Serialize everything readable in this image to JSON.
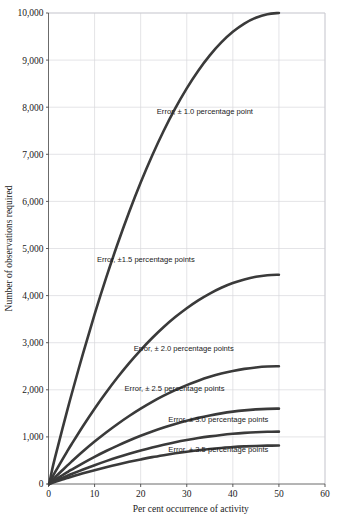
{
  "chart_data": {
    "type": "line",
    "title": "",
    "xlabel": "Per cent occurrence of activity",
    "ylabel": "Number of observations required",
    "xlim": [
      0,
      60
    ],
    "ylim": [
      0,
      10000
    ],
    "xticks": [
      0,
      10,
      20,
      30,
      40,
      50,
      60
    ],
    "xtick_labels": [
      "0",
      "10",
      "20",
      "30",
      "40",
      "50",
      "60"
    ],
    "yticks": [
      0,
      1000,
      2000,
      3000,
      4000,
      5000,
      6000,
      7000,
      8000,
      9000,
      10000
    ],
    "ytick_labels": [
      "0",
      "1,000",
      "2,000",
      "3,000",
      "4,000",
      "5,000",
      "6,000",
      "7,000",
      "8,000",
      "9,000",
      "10,000"
    ],
    "grid": true,
    "legend_position": "inline-annotations",
    "x": [
      1,
      2,
      3,
      4,
      5,
      7.5,
      10,
      12.5,
      15,
      17.5,
      20,
      22.5,
      25,
      27.5,
      30,
      32.5,
      35,
      37.5,
      40,
      42.5,
      45,
      47.5,
      50
    ],
    "series": [
      {
        "name": "Error, ± 1.0 percentage point",
        "error": 1.0,
        "label": "Error,  ± 1.0 percentage point",
        "label_x": 23.5,
        "label_y": 7850,
        "values": [
          396,
          784,
          1164,
          1536,
          1900,
          2775,
          3600,
          4375,
          5100,
          5775,
          6400,
          6975,
          7500,
          7975,
          8400,
          8775,
          9100,
          9375,
          9600,
          9775,
          9900,
          9975,
          10000
        ]
      },
      {
        "name": "Error, ± 1.5 percentage points",
        "error": 1.5,
        "label": "Error,  ±1.5 percentage points",
        "label_x": 10.5,
        "label_y": 4710,
        "values": [
          176,
          348,
          517,
          683,
          844,
          1233,
          1600,
          1944,
          2267,
          2567,
          2844,
          3100,
          3333,
          3544,
          3733,
          3900,
          4044,
          4167,
          4267,
          4344,
          4400,
          4433,
          4444
        ]
      },
      {
        "name": "Error, ± 2.0 percentage points",
        "error": 2.0,
        "label": "Error,  ± 2.0 percentage points",
        "label_x": 18.5,
        "label_y": 2830,
        "values": [
          99,
          196,
          291,
          384,
          475,
          694,
          900,
          1094,
          1275,
          1444,
          1600,
          1744,
          1875,
          1994,
          2100,
          2194,
          2275,
          2344,
          2400,
          2444,
          2475,
          2494,
          2500
        ]
      },
      {
        "name": "Error, ± 2.5 percentage points",
        "error": 2.5,
        "label": "Error,  ± 2.5 percentage points",
        "label_x": 16.5,
        "label_y": 1980,
        "values": [
          63,
          125,
          186,
          246,
          304,
          444,
          576,
          700,
          816,
          924,
          1024,
          1116,
          1200,
          1276,
          1344,
          1404,
          1456,
          1500,
          1536,
          1564,
          1584,
          1596,
          1600
        ]
      },
      {
        "name": "Error, ± 3.0 percentage points",
        "error": 3.0,
        "label": "Error,  ± 3.0 percentage points",
        "label_x": 26.0,
        "label_y": 1315,
        "values": [
          44,
          87,
          129,
          171,
          211,
          308,
          400,
          486,
          567,
          642,
          711,
          775,
          833,
          886,
          933,
          975,
          1011,
          1042,
          1067,
          1086,
          1100,
          1108,
          1111
        ]
      },
      {
        "name": "Error, ± 3.5 percentage points",
        "error": 3.5,
        "label": "Error,  ± 3.5 percentage points",
        "label_x": 26.0,
        "label_y": 690,
        "values": [
          32,
          64,
          95,
          125,
          155,
          227,
          294,
          357,
          416,
          471,
          522,
          570,
          612,
          651,
          686,
          716,
          743,
          765,
          784,
          798,
          808,
          814,
          816
        ]
      }
    ]
  },
  "colors": {
    "curve": "#3a3a3a",
    "grid": "#d8d8dc",
    "axis": "#5a5a5a",
    "background": "#ffffff",
    "text": "#1a1a1a"
  }
}
